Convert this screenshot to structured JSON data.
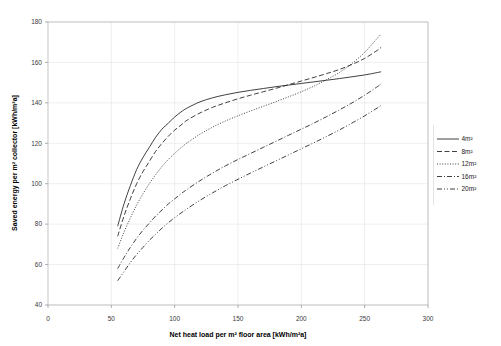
{
  "chart_data": {
    "type": "line",
    "title": "",
    "xlabel": "Net heat load per m² floor area [kWh/m²a]",
    "ylabel": "Saved energy per m² collector [kWh/m²a]",
    "xlim": [
      0,
      300
    ],
    "ylim": [
      40,
      180
    ],
    "xticks": [
      0,
      50,
      100,
      150,
      200,
      250,
      300
    ],
    "yticks": [
      40,
      60,
      80,
      100,
      120,
      140,
      160,
      180
    ],
    "xtick_labels": [
      "0",
      "50",
      "100",
      "150",
      "200",
      "250",
      "300"
    ],
    "ytick_labels": [
      "40",
      "60",
      "80",
      "100",
      "120",
      "140",
      "160",
      "180"
    ],
    "grid": true,
    "legend_position": "right",
    "line_color": "#2b2b2b",
    "grid_color": "#e6e6e6",
    "frame_color": "#b8b8b8",
    "series": [
      {
        "name": "4m²",
        "dash": "none",
        "x": [
          55,
          60,
          65,
          70,
          75,
          80,
          85,
          90,
          95,
          100,
          105,
          110,
          120,
          130,
          140,
          150,
          160,
          170,
          180,
          190,
          200,
          210,
          220,
          230,
          240,
          250,
          260,
          263
        ],
        "y": [
          79,
          90,
          99,
          107,
          113,
          118,
          123,
          127,
          130,
          133,
          135.5,
          137.5,
          140.5,
          142.5,
          144,
          145.2,
          146.2,
          147.1,
          148,
          148.8,
          149.6,
          150.4,
          151.2,
          152,
          152.9,
          153.8,
          155,
          155.4
        ]
      },
      {
        "name": "8m²",
        "dash": "dashed",
        "x": [
          55,
          60,
          65,
          70,
          75,
          80,
          85,
          90,
          95,
          100,
          105,
          110,
          120,
          130,
          140,
          150,
          160,
          170,
          180,
          190,
          200,
          210,
          220,
          230,
          240,
          250,
          260,
          263
        ],
        "y": [
          74,
          84,
          92.5,
          100,
          106,
          111,
          116,
          120,
          123.5,
          126.5,
          129,
          131.5,
          135,
          137.8,
          140,
          142,
          143.8,
          145.5,
          147.2,
          149,
          150.8,
          152.6,
          154.5,
          156.5,
          159,
          162,
          166,
          167.5
        ]
      },
      {
        "name": "12m²",
        "dash": "dotted",
        "x": [
          55,
          60,
          65,
          70,
          75,
          80,
          85,
          90,
          95,
          100,
          105,
          110,
          120,
          130,
          140,
          150,
          160,
          170,
          180,
          190,
          200,
          210,
          220,
          230,
          240,
          250,
          260,
          263
        ],
        "y": [
          68,
          76,
          83,
          89.5,
          95,
          100,
          104.5,
          108.5,
          112,
          115,
          117.8,
          120.3,
          124.5,
          128,
          131,
          133.6,
          136,
          138.3,
          140.6,
          143,
          145.5,
          148.3,
          151.5,
          155,
          159.5,
          165,
          172,
          174
        ]
      },
      {
        "name": "16m²",
        "dash": "dashdot",
        "x": [
          55,
          60,
          65,
          70,
          75,
          80,
          85,
          90,
          95,
          100,
          105,
          110,
          120,
          130,
          140,
          150,
          160,
          170,
          180,
          190,
          200,
          210,
          220,
          230,
          240,
          250,
          260,
          263
        ],
        "y": [
          58,
          63.5,
          68.5,
          73,
          77,
          80.5,
          84,
          87,
          90,
          92.5,
          95,
          97.3,
          101.5,
          105.3,
          108.8,
          112,
          115,
          118,
          121,
          124,
          127,
          130,
          133.2,
          136.5,
          140,
          143.8,
          148,
          149.5
        ]
      },
      {
        "name": "20m²",
        "dash": "dashdotdot",
        "x": [
          55,
          60,
          65,
          70,
          75,
          80,
          85,
          90,
          95,
          100,
          105,
          110,
          120,
          130,
          140,
          150,
          160,
          170,
          180,
          190,
          200,
          210,
          220,
          230,
          240,
          250,
          260,
          263
        ],
        "y": [
          52,
          56.5,
          61,
          65,
          68.5,
          72,
          75,
          78,
          80.7,
          83.2,
          85.5,
          87.7,
          91.8,
          95.5,
          99,
          102.2,
          105.3,
          108.3,
          111.3,
          114.3,
          117.3,
          120.3,
          123.4,
          126.6,
          130,
          133.6,
          137.5,
          138.8
        ]
      }
    ]
  },
  "legend": {
    "items": [
      {
        "label": "4m²"
      },
      {
        "label": "8m²"
      },
      {
        "label": "12m²"
      },
      {
        "label": "16m²"
      },
      {
        "label": "20m²"
      }
    ]
  }
}
